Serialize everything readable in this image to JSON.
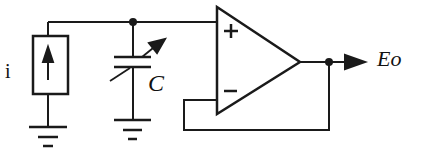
{
  "diagram": {
    "type": "circuit-schematic",
    "title": "",
    "components": [
      {
        "id": "current-source",
        "kind": "current source",
        "label": "i",
        "direction": "up"
      },
      {
        "id": "variable-capacitor",
        "kind": "variable capacitor",
        "label": "C"
      },
      {
        "id": "op-amp",
        "kind": "operational amplifier (voltage follower)",
        "pins": {
          "plus": "+",
          "minus": "−"
        }
      },
      {
        "id": "ground-1",
        "kind": "ground"
      },
      {
        "id": "ground-2",
        "kind": "ground"
      }
    ],
    "output": {
      "label": "Eo"
    },
    "connections": [
      "current-source top -> node A",
      "variable-capacitor top -> node A",
      "node A -> op-amp +",
      "op-amp output -> node B -> Eo",
      "node B -> op-amp − (feedback)",
      "current-source bottom -> ground-1",
      "variable-capacitor bottom -> ground-2"
    ]
  },
  "labels": {
    "source": "i",
    "capacitor": "C",
    "plus": "+",
    "minus": "−",
    "output": "Eo"
  },
  "colors": {
    "stroke": "#1a1a1a",
    "background": "#ffffff"
  }
}
